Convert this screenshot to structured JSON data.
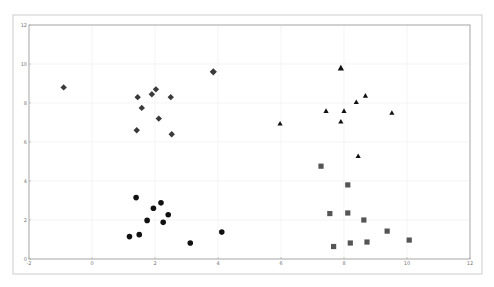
{
  "chart_data": {
    "type": "scatter",
    "title": "",
    "xlabel": "",
    "ylabel": "",
    "xlim": [
      -2,
      12
    ],
    "ylim": [
      0,
      12
    ],
    "xticks": [
      -2,
      0,
      2,
      4,
      6,
      8,
      10,
      12
    ],
    "yticks": [
      0,
      2,
      4,
      6,
      8,
      10,
      12
    ],
    "grid": true,
    "legend": null,
    "series": [
      {
        "name": "diamonds",
        "marker": "diamond",
        "color": "#3a3a3a",
        "points": [
          {
            "x": -0.9,
            "y": 8.8
          },
          {
            "x": 1.45,
            "y": 8.3
          },
          {
            "x": 1.9,
            "y": 8.45
          },
          {
            "x": 2.03,
            "y": 8.7
          },
          {
            "x": 2.5,
            "y": 8.3
          },
          {
            "x": 1.58,
            "y": 7.75
          },
          {
            "x": 2.12,
            "y": 7.2
          },
          {
            "x": 1.42,
            "y": 6.6
          },
          {
            "x": 2.53,
            "y": 6.4
          },
          {
            "x": 3.85,
            "y": 9.6,
            "size": "large"
          }
        ]
      },
      {
        "name": "circles",
        "marker": "circle",
        "color": "#111111",
        "points": [
          {
            "x": 1.4,
            "y": 3.15
          },
          {
            "x": 1.95,
            "y": 2.6
          },
          {
            "x": 2.19,
            "y": 2.88
          },
          {
            "x": 2.42,
            "y": 2.27
          },
          {
            "x": 1.75,
            "y": 1.98
          },
          {
            "x": 2.26,
            "y": 1.88
          },
          {
            "x": 1.19,
            "y": 1.15
          },
          {
            "x": 1.5,
            "y": 1.25
          },
          {
            "x": 3.12,
            "y": 0.82
          },
          {
            "x": 4.12,
            "y": 1.38
          }
        ]
      },
      {
        "name": "triangles",
        "marker": "triangle",
        "color": "#111111",
        "points": [
          {
            "x": 7.9,
            "y": 9.8,
            "size": "large"
          },
          {
            "x": 8.68,
            "y": 8.38
          },
          {
            "x": 8.39,
            "y": 8.05
          },
          {
            "x": 7.43,
            "y": 7.6
          },
          {
            "x": 8.0,
            "y": 7.6
          },
          {
            "x": 9.52,
            "y": 7.5
          },
          {
            "x": 7.9,
            "y": 7.05
          },
          {
            "x": 5.97,
            "y": 6.95
          },
          {
            "x": 8.45,
            "y": 5.28
          }
        ]
      },
      {
        "name": "squares",
        "marker": "square",
        "color": "#555555",
        "points": [
          {
            "x": 7.27,
            "y": 4.76
          },
          {
            "x": 8.12,
            "y": 3.8
          },
          {
            "x": 7.55,
            "y": 2.33
          },
          {
            "x": 8.12,
            "y": 2.36
          },
          {
            "x": 8.63,
            "y": 2.0
          },
          {
            "x": 9.37,
            "y": 1.43
          },
          {
            "x": 10.07,
            "y": 0.97
          },
          {
            "x": 7.67,
            "y": 0.64
          },
          {
            "x": 8.2,
            "y": 0.82
          },
          {
            "x": 8.73,
            "y": 0.87
          }
        ]
      }
    ]
  },
  "layout": {
    "outer_frame": {
      "x": 13,
      "y": 15,
      "w": 469,
      "h": 259
    },
    "plot": {
      "x0": 29,
      "x1": 470,
      "y0": 259,
      "y1": 25
    },
    "grid_color": "#ececec",
    "axis_color": "#aaaaaa",
    "frame_color": "#cccccc"
  }
}
